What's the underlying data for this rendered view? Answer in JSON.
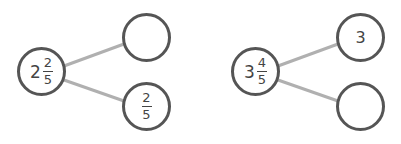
{
  "colors": {
    "circle_stroke": "#555555",
    "connector": "#b0b0b0",
    "text": "#444444"
  },
  "bonds": [
    {
      "whole": {
        "int": "2",
        "numerator": "2",
        "denominator": "5"
      },
      "part_top": {
        "value": ""
      },
      "part_bottom": {
        "numerator": "2",
        "denominator": "5"
      }
    },
    {
      "whole": {
        "int": "3",
        "numerator": "4",
        "denominator": "5"
      },
      "part_top": {
        "value": "3"
      },
      "part_bottom": {
        "value": ""
      }
    }
  ]
}
